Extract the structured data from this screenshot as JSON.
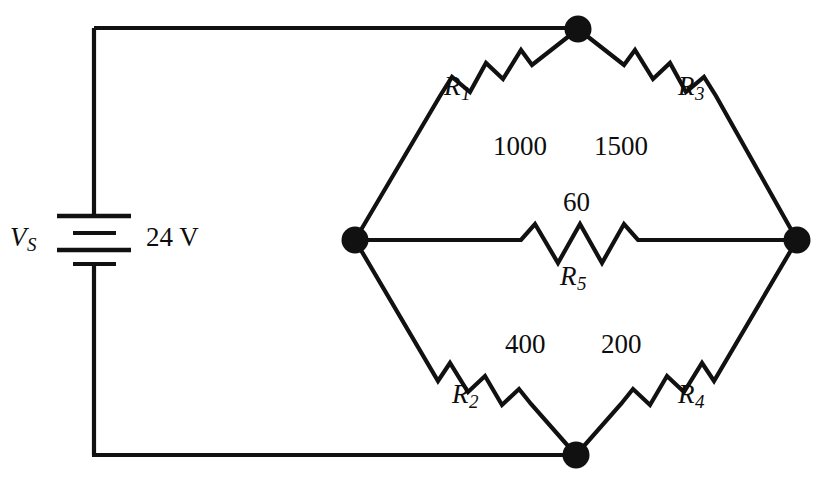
{
  "diagram": {
    "kind": "circuit-schematic",
    "stroke_color": "#111111",
    "background_color": "#ffffff"
  },
  "source": {
    "symbol": "V",
    "symbol_subscript": "S",
    "value": "24 V"
  },
  "resistors": [
    {
      "id": "R1",
      "symbol": "R",
      "subscript": "1",
      "value": "1000",
      "position": "top-left-branch"
    },
    {
      "id": "R3",
      "symbol": "R",
      "subscript": "3",
      "value": "1500",
      "position": "top-right-branch"
    },
    {
      "id": "R5",
      "symbol": "R",
      "subscript": "5",
      "value": "60",
      "position": "bridge-middle"
    },
    {
      "id": "R2",
      "symbol": "R",
      "subscript": "2",
      "value": "400",
      "position": "bottom-left-branch"
    },
    {
      "id": "R4",
      "symbol": "R",
      "subscript": "4",
      "value": "200",
      "position": "bottom-right-branch"
    }
  ],
  "nodes": [
    {
      "id": "node-top",
      "label": ""
    },
    {
      "id": "node-left",
      "label": ""
    },
    {
      "id": "node-right",
      "label": ""
    },
    {
      "id": "node-bottom",
      "label": ""
    }
  ]
}
